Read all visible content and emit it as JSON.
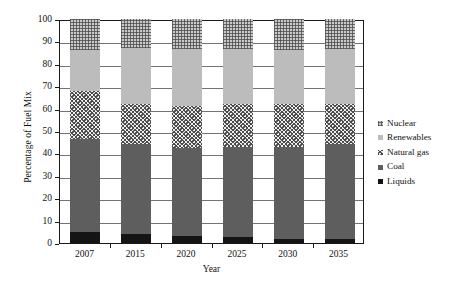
{
  "chart_data": {
    "type": "bar",
    "stacked": true,
    "title": "",
    "xlabel": "Year",
    "ylabel": "Percentage of Fuel Mix",
    "categories": [
      "2007",
      "2015",
      "2020",
      "2025",
      "2030",
      "2035"
    ],
    "ylim": [
      0,
      100
    ],
    "yticks": [
      0,
      10,
      20,
      30,
      40,
      50,
      60,
      70,
      80,
      90,
      100
    ],
    "ytick_labels": [
      "0",
      "10",
      "20",
      "30",
      "40",
      "50",
      "60",
      "70",
      "80",
      "90",
      "100"
    ],
    "grid": true,
    "legend_position": "right",
    "series": [
      {
        "name": "Liquids",
        "pattern": "solid-black",
        "color": "#141414",
        "values": [
          5.0,
          4.0,
          3.0,
          2.5,
          2.0,
          2.0
        ]
      },
      {
        "name": "Coal",
        "pattern": "solid-gray",
        "color": "#5e5e5e",
        "values": [
          41.5,
          40.0,
          39.5,
          40.5,
          41.0,
          42.0
        ]
      },
      {
        "name": "Natural gas",
        "pattern": "speckled",
        "color": "#efefef",
        "values": [
          21.5,
          18.0,
          18.5,
          19.0,
          19.0,
          18.0
        ]
      },
      {
        "name": "Renewables",
        "pattern": "solid-light",
        "color": "#bcbcbc",
        "values": [
          18.0,
          25.0,
          25.5,
          24.5,
          24.0,
          24.5
        ]
      },
      {
        "name": "Nuclear",
        "pattern": "crosshatch",
        "color": "#c9c9c9",
        "values": [
          14.0,
          13.0,
          13.5,
          13.5,
          14.0,
          13.5
        ]
      }
    ],
    "series_order_bottom_to_top": [
      "Liquids",
      "Coal",
      "Natural gas",
      "Renewables",
      "Nuclear"
    ],
    "legend_entries": [
      "Nuclear",
      "Renewables",
      "Natural gas",
      "Coal",
      "Liquids"
    ],
    "cumulative_tops": {
      "Liquids": [
        5.0,
        4.0,
        3.0,
        2.5,
        2.0,
        2.0
      ],
      "Coal": [
        46.5,
        44.0,
        42.5,
        43.0,
        43.0,
        44.0
      ],
      "Natural gas": [
        68.0,
        62.0,
        61.0,
        62.0,
        62.0,
        62.0
      ],
      "Renewables": [
        86.0,
        87.0,
        86.5,
        86.5,
        86.0,
        86.5
      ],
      "Nuclear": [
        100,
        100,
        100,
        100,
        100,
        100
      ]
    }
  }
}
